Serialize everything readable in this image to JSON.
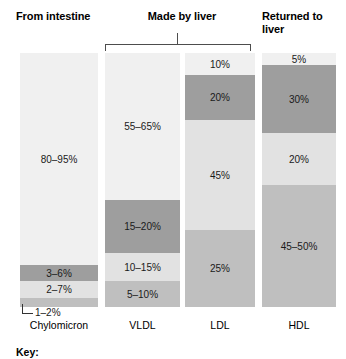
{
  "headings": {
    "from_intestine": "From intestine",
    "made_by_liver": "Made by liver",
    "returned_to_liver": "Returned to\nliver"
  },
  "key": {
    "label": "Key:"
  },
  "colors": {
    "lightest": "#f0f0f0",
    "light": "#e2e2e2",
    "medium": "#bfbfbf",
    "dark": "#9e9e9e",
    "bracket": "#4d4d4d",
    "text": "#1a1a1a"
  },
  "chart_data": {
    "type": "bar",
    "xlabel": "",
    "ylabel": "",
    "stacked": true,
    "ylim": [
      0,
      100
    ],
    "grid": false,
    "legend_position": "bottom",
    "categories": [
      "Chylomicron",
      "VLDL",
      "LDL",
      "HDL"
    ],
    "group_labels": [
      {
        "label": "From intestine",
        "columns": [
          "Chylomicron"
        ]
      },
      {
        "label": "Made by liver",
        "columns": [
          "VLDL",
          "LDL"
        ]
      },
      {
        "label": "Returned to liver",
        "columns": [
          "HDL"
        ]
      }
    ],
    "columns": [
      {
        "name": "Chylomicron",
        "caption": "Chylomicron",
        "segments": [
          {
            "label": "80–95%",
            "shade": "lightest",
            "value": 87.5,
            "range": [
              80,
              95
            ],
            "height_px": 212,
            "label_inside": true
          },
          {
            "label": "3–6%",
            "shade": "dark",
            "value": 4.5,
            "range": [
              3,
              6
            ],
            "height_px": 16,
            "label_inside": true
          },
          {
            "label": "2–7%",
            "shade": "light",
            "value": 4.5,
            "range": [
              2,
              7
            ],
            "height_px": 17,
            "label_inside": true
          },
          {
            "label": "1–2%",
            "shade": "medium",
            "value": 1.5,
            "range": [
              1,
              2
            ],
            "height_px": 9,
            "label_inside": false
          }
        ]
      },
      {
        "name": "VLDL",
        "caption": "VLDL",
        "segments": [
          {
            "label": "55–65%",
            "shade": "lightest",
            "value": 60,
            "range": [
              55,
              65
            ],
            "height_px": 147,
            "label_inside": true
          },
          {
            "label": "15–20%",
            "shade": "dark",
            "value": 17.5,
            "range": [
              15,
              20
            ],
            "height_px": 53,
            "label_inside": true
          },
          {
            "label": "10–15%",
            "shade": "light",
            "value": 12.5,
            "range": [
              10,
              15
            ],
            "height_px": 28,
            "label_inside": true
          },
          {
            "label": "5–10%",
            "shade": "medium",
            "value": 7.5,
            "range": [
              5,
              10
            ],
            "height_px": 26,
            "label_inside": true
          }
        ]
      },
      {
        "name": "LDL",
        "caption": "LDL",
        "segments": [
          {
            "label": "10%",
            "shade": "lightest",
            "value": 10,
            "range": [
              10,
              10
            ],
            "height_px": 22,
            "label_inside": true
          },
          {
            "label": "20%",
            "shade": "dark",
            "value": 20,
            "range": [
              20,
              20
            ],
            "height_px": 45,
            "label_inside": true
          },
          {
            "label": "45%",
            "shade": "light",
            "value": 45,
            "range": [
              45,
              45
            ],
            "height_px": 110,
            "label_inside": true
          },
          {
            "label": "25%",
            "shade": "medium",
            "value": 25,
            "range": [
              25,
              25
            ],
            "height_px": 77,
            "label_inside": true
          }
        ]
      },
      {
        "name": "HDL",
        "caption": "HDL",
        "segments": [
          {
            "label": "5%",
            "shade": "lightest",
            "value": 5,
            "range": [
              5,
              5
            ],
            "height_px": 12,
            "label_inside": true
          },
          {
            "label": "30%",
            "shade": "dark",
            "value": 30,
            "range": [
              30,
              30
            ],
            "height_px": 68,
            "label_inside": true
          },
          {
            "label": "20%",
            "shade": "light",
            "value": 20,
            "range": [
              20,
              20
            ],
            "height_px": 52,
            "label_inside": true
          },
          {
            "label": "45–50%",
            "shade": "medium",
            "value": 47.5,
            "range": [
              45,
              50
            ],
            "height_px": 122,
            "label_inside": true
          }
        ]
      }
    ],
    "callouts": [
      {
        "column": "Chylomicron",
        "label": "1–2%",
        "target_segment_index": 3
      }
    ]
  }
}
